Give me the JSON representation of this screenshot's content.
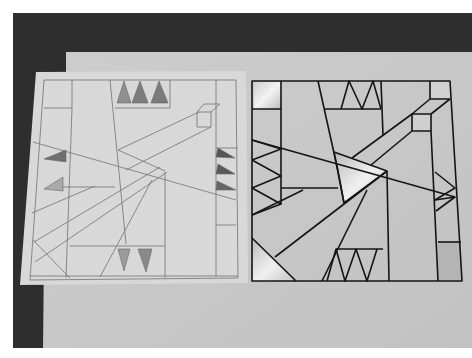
{
  "scene": {
    "description": "Photograph of two geometric quilt block designs on paper: a pencil sketch on the left and a finished black-outlined line drawing on the right",
    "colors": {
      "background_dark": "#2e2e2e",
      "paper_large": "#c9c9c9",
      "paper_sketch": "#d6d6d6",
      "pencil_line": "#7a7a7a",
      "ink_line": "#151515",
      "shaded_triangle": "#8a8a8a",
      "bevel_light": "#efefef"
    }
  },
  "left_sketch": {
    "label": "pencil sketch",
    "top_triangles_count": 3,
    "left_triangles_count": 2,
    "right_triangles_count": 3,
    "bottom_triangles_count": 2
  },
  "right_drawing": {
    "label": "inked design",
    "top_zigzag_peaks": 2,
    "bottom_zigzag_valleys": 3,
    "left_chevrons": 3,
    "right_chevrons": 2,
    "beveled_squares": 4,
    "beveled_triangles": 2
  }
}
